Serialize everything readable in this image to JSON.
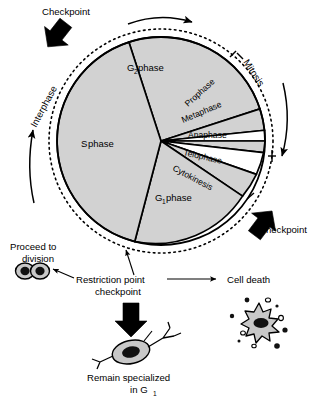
{
  "figure": {
    "colors": {
      "ink": "#000000",
      "background": "#ffffff",
      "wedge_fill": "#d2d2d2",
      "wedge_fill_alt": "#ffffff",
      "cell_fill": "#c8c8c8",
      "nucleus_fill": "#111111"
    }
  },
  "cycle": {
    "interphase_label": "Interphase",
    "mitosis_label": "Mitosis",
    "phases": [
      {
        "id": "g2",
        "label": "G",
        "sub": "2",
        "suffix": " phase",
        "full": "G2 phase"
      },
      {
        "id": "s",
        "label": "S",
        "sub": "",
        "suffix": " phase",
        "full": "S phase"
      },
      {
        "id": "g1",
        "label": "G",
        "sub": "1",
        "suffix": " phase",
        "full": "G1 phase"
      }
    ],
    "mitosis_stages": [
      {
        "id": "prophase",
        "label": "Prophase"
      },
      {
        "id": "metaphase",
        "label": "Metaphase"
      },
      {
        "id": "anaphase",
        "label": "Anaphase"
      },
      {
        "id": "telophase",
        "label": "Telophase"
      },
      {
        "id": "cytokinesis",
        "label": "Cytokinesis"
      }
    ]
  },
  "checkpoints": {
    "top_label": "Checkpoint",
    "bottom_label": "Checkpoint",
    "restriction_line1": "Restriction point",
    "restriction_line2": "checkpoint"
  },
  "outcomes": {
    "proceed_line1": "Proceed to",
    "proceed_line2": "division",
    "cell_death": "Cell death",
    "remain_line1": "Remain specialized",
    "remain_line2_pre": "in G",
    "remain_line2_sub": "1"
  }
}
